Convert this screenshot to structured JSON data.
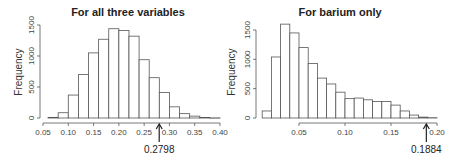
{
  "chart_data": [
    {
      "type": "bar",
      "title": "For all three variables",
      "xlabel": "",
      "ylabel": "Frequency",
      "bin_edges": [
        0.06,
        0.08,
        0.1,
        0.12,
        0.14,
        0.16,
        0.18,
        0.2,
        0.22,
        0.24,
        0.26,
        0.28,
        0.3,
        0.32,
        0.34,
        0.36,
        0.38,
        0.4
      ],
      "values": [
        10,
        85,
        370,
        700,
        1050,
        1270,
        1440,
        1410,
        1320,
        940,
        650,
        410,
        180,
        70,
        30,
        8,
        2
      ],
      "xticks": [
        "0.05",
        "0.10",
        "0.15",
        "0.20",
        "0.25",
        "0.30",
        "0.35",
        "0.40"
      ],
      "xtick_values": [
        0.05,
        0.1,
        0.15,
        0.2,
        0.25,
        0.3,
        0.35,
        0.4
      ],
      "yticks": [
        "0",
        "500",
        "1000",
        "1500"
      ],
      "ytick_values": [
        0,
        500,
        1000,
        1500
      ],
      "xlim": [
        0.05,
        0.4
      ],
      "ylim": [
        0,
        1500
      ],
      "grid": false,
      "annotation": {
        "label": "0.2798",
        "x": 0.2798
      }
    },
    {
      "type": "bar",
      "title": "For barium only",
      "xlabel": "",
      "ylabel": "Frequency",
      "bin_edges": [
        0.01,
        0.02,
        0.03,
        0.04,
        0.05,
        0.06,
        0.07,
        0.08,
        0.09,
        0.1,
        0.11,
        0.12,
        0.13,
        0.14,
        0.15,
        0.16,
        0.17,
        0.18,
        0.19,
        0.2
      ],
      "values": [
        120,
        1040,
        1600,
        1450,
        1200,
        930,
        680,
        580,
        440,
        330,
        340,
        310,
        280,
        280,
        220,
        120,
        50,
        15,
        5
      ],
      "xticks": [
        "0.05",
        "0.10",
        "0.15",
        "0.20"
      ],
      "xtick_values": [
        0.05,
        0.1,
        0.15,
        0.2
      ],
      "yticks": [
        "0",
        "500",
        "1000",
        "1500"
      ],
      "ytick_values": [
        0,
        500,
        1000,
        1500
      ],
      "xlim": [
        0.05,
        0.2
      ],
      "ylim": [
        0,
        1500
      ],
      "grid": false,
      "annotation": {
        "label": "0.1884",
        "x": 0.1884
      }
    }
  ]
}
